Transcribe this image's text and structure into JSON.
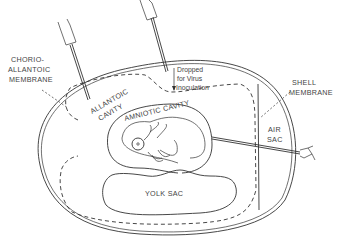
{
  "diagram": {
    "labels": {
      "chorioallantoic_1": "CHORIO-",
      "chorioallantoic_2": "ALLANTOIC",
      "chorioallantoic_3": "MEMBRANE",
      "allantoic_1": "ALLANTOIC",
      "allantoic_2": "CAVITY",
      "amniotic": "AMNIOTIC CAVITY",
      "dropped_1": "Dropped",
      "dropped_2": "for Virus",
      "dropped_3": "Inoculation",
      "shell_1": "SHELL",
      "shell_2": "MEMBRANE",
      "air_1": "AIR",
      "air_2": "SAC",
      "yolk": "YOLK SAC"
    },
    "needles": [
      {
        "name": "allantoic-needle",
        "target": "allantoic cavity"
      },
      {
        "name": "chorioallantoic-needle",
        "target": "chorioallantoic membrane"
      },
      {
        "name": "amniotic-needle",
        "target": "amniotic cavity"
      }
    ],
    "colors": {
      "ink": "#333333",
      "background": "#ffffff"
    }
  }
}
